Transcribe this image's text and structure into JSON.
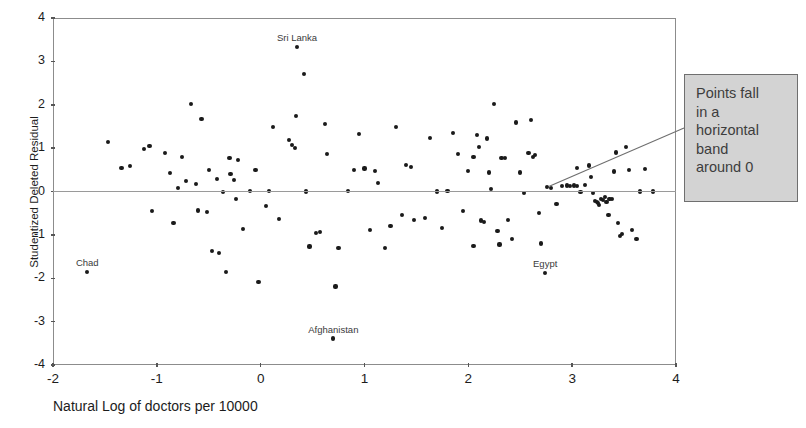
{
  "chart_data": {
    "type": "scatter",
    "title": "",
    "xlabel": "Natural Log of doctors per 10000",
    "ylabel": "Studentized Deleted Residual",
    "xlim": [
      -2,
      4
    ],
    "ylim": [
      -4,
      4
    ],
    "xticks": [
      -2,
      -1,
      0,
      1,
      2,
      3,
      4
    ],
    "xticklabels": [
      "-2",
      "-1",
      "0",
      "1",
      "2",
      "3",
      "4"
    ],
    "yticks": [
      -4,
      -3,
      -2,
      -1,
      0,
      1,
      2,
      3,
      4
    ],
    "yticklabels": [
      "-4",
      "-3",
      "-2",
      "-1",
      "0",
      "1",
      "2",
      "3",
      "4"
    ],
    "grid": false,
    "reference_line": {
      "axis": "y",
      "value": 0
    },
    "legend": null,
    "marker": {
      "shape": "circle",
      "color": "#1a1a1a",
      "size": 4
    },
    "points": [
      [
        -1.67,
        -1.86
      ],
      [
        -1.47,
        1.14
      ],
      [
        -1.34,
        0.54
      ],
      [
        -1.26,
        0.58
      ],
      [
        -1.12,
        0.98
      ],
      [
        -1.07,
        1.04
      ],
      [
        -1.05,
        -0.45
      ],
      [
        -0.92,
        0.88
      ],
      [
        -0.87,
        0.43
      ],
      [
        -0.84,
        -0.73
      ],
      [
        -0.8,
        0.09
      ],
      [
        -0.76,
        0.8
      ],
      [
        -0.72,
        0.25
      ],
      [
        -0.67,
        2.02
      ],
      [
        -0.62,
        0.17
      ],
      [
        -0.6,
        -0.44
      ],
      [
        -0.57,
        1.67
      ],
      [
        -0.52,
        -0.48
      ],
      [
        -0.5,
        0.49
      ],
      [
        -0.47,
        -1.37
      ],
      [
        -0.42,
        0.28
      ],
      [
        -0.4,
        -1.42
      ],
      [
        -0.36,
        -0.02
      ],
      [
        -0.33,
        -1.85
      ],
      [
        -0.29,
        0.4
      ],
      [
        -0.26,
        0.26
      ],
      [
        -0.24,
        -0.17
      ],
      [
        -0.22,
        0.72
      ],
      [
        -0.17,
        -0.86
      ],
      [
        -0.1,
        0.02
      ],
      [
        -0.05,
        0.5
      ],
      [
        -0.02,
        -2.08
      ],
      [
        0.08,
        0.01
      ],
      [
        0.12,
        1.48
      ],
      [
        0.18,
        -0.64
      ],
      [
        0.27,
        1.19
      ],
      [
        0.3,
        1.07
      ],
      [
        0.33,
        1.0
      ],
      [
        0.34,
        1.74
      ],
      [
        0.35,
        3.33
      ],
      [
        0.42,
        2.7
      ],
      [
        0.44,
        0.0
      ],
      [
        0.47,
        -1.27
      ],
      [
        0.53,
        -0.96
      ],
      [
        0.57,
        -0.94
      ],
      [
        0.62,
        1.56
      ],
      [
        0.64,
        0.87
      ],
      [
        0.7,
        -3.39
      ],
      [
        0.72,
        -2.19
      ],
      [
        0.75,
        -1.3
      ],
      [
        0.84,
        0.02
      ],
      [
        0.9,
        0.5
      ],
      [
        0.95,
        1.32
      ],
      [
        1.0,
        0.53
      ],
      [
        1.05,
        -0.88
      ],
      [
        1.1,
        0.48
      ],
      [
        1.13,
        0.2
      ],
      [
        1.25,
        -0.8
      ],
      [
        1.3,
        1.48
      ],
      [
        1.36,
        -0.54
      ],
      [
        1.4,
        0.62
      ],
      [
        1.45,
        0.57
      ],
      [
        1.48,
        -0.66
      ],
      [
        1.58,
        -0.62
      ],
      [
        1.63,
        1.23
      ],
      [
        1.7,
        0.0
      ],
      [
        1.75,
        -0.85
      ],
      [
        1.8,
        0.02
      ],
      [
        1.85,
        1.35
      ],
      [
        1.9,
        0.86
      ],
      [
        1.95,
        -0.45
      ],
      [
        2.0,
        0.48
      ],
      [
        2.05,
        0.8
      ],
      [
        2.08,
        1.3
      ],
      [
        2.1,
        1.03
      ],
      [
        2.12,
        -0.67
      ],
      [
        2.15,
        -0.7
      ],
      [
        2.18,
        1.22
      ],
      [
        2.2,
        0.44
      ],
      [
        2.22,
        0.05
      ],
      [
        2.25,
        2.02
      ],
      [
        2.28,
        -0.92
      ],
      [
        2.32,
        0.78
      ],
      [
        2.35,
        0.78
      ],
      [
        2.38,
        -0.65
      ],
      [
        2.42,
        -1.1
      ],
      [
        2.46,
        1.59
      ],
      [
        2.5,
        0.44
      ],
      [
        2.54,
        -0.03
      ],
      [
        2.58,
        0.88
      ],
      [
        2.6,
        1.65
      ],
      [
        2.62,
        0.8
      ],
      [
        2.64,
        0.85
      ],
      [
        2.68,
        -0.5
      ],
      [
        2.7,
        -1.2
      ],
      [
        2.74,
        -1.88
      ],
      [
        2.76,
        0.1
      ],
      [
        2.8,
        0.08
      ],
      [
        2.85,
        -0.28
      ],
      [
        2.9,
        0.12
      ],
      [
        2.95,
        0.14
      ],
      [
        2.98,
        0.13
      ],
      [
        3.02,
        0.14
      ],
      [
        3.05,
        0.12
      ],
      [
        3.08,
        -0.02
      ],
      [
        3.12,
        0.15
      ],
      [
        3.16,
        0.6
      ],
      [
        3.18,
        0.33
      ],
      [
        3.2,
        -0.04
      ],
      [
        3.22,
        -0.22
      ],
      [
        3.24,
        -0.25
      ],
      [
        3.25,
        -0.26
      ],
      [
        3.26,
        -0.32
      ],
      [
        3.28,
        -0.18
      ],
      [
        3.3,
        -0.2
      ],
      [
        3.32,
        -0.12
      ],
      [
        3.33,
        -0.24
      ],
      [
        3.35,
        -0.55
      ],
      [
        3.36,
        -0.17
      ],
      [
        3.38,
        -0.18
      ],
      [
        3.4,
        0.46
      ],
      [
        3.42,
        0.9
      ],
      [
        3.44,
        -0.72
      ],
      [
        3.46,
        -1.02
      ],
      [
        3.48,
        -0.98
      ],
      [
        3.52,
        1.02
      ],
      [
        3.55,
        0.5
      ],
      [
        3.58,
        -0.88
      ],
      [
        3.62,
        -1.1
      ],
      [
        3.65,
        0.0
      ],
      [
        3.7,
        0.52
      ],
      [
        3.78,
        0.0
      ],
      [
        -0.3,
        0.78
      ],
      [
        0.05,
        -0.33
      ],
      [
        1.2,
        -1.3
      ],
      [
        2.05,
        -1.25
      ],
      [
        2.3,
        -1.22
      ],
      [
        3.05,
        0.55
      ]
    ],
    "point_labels": [
      {
        "text": "Chad",
        "x": -1.67,
        "y": -1.86
      },
      {
        "text": "Sri Lanka",
        "x": 0.35,
        "y": 3.33
      },
      {
        "text": "Afghanistan",
        "x": 0.7,
        "y": -3.39
      },
      {
        "text": "Egypt",
        "x": 2.74,
        "y": -1.88
      }
    ],
    "annotations": [
      {
        "id": "callout",
        "text": "Points fall in a horizontal band around 0",
        "lines": [
          "Points fall",
          "in a",
          "horizontal",
          "band",
          "around 0"
        ],
        "background": "#d3d3d3",
        "border": "#6f6f6f",
        "leader_from": {
          "x": 2.78,
          "y": 0.12
        },
        "leader_to_px": {
          "x": 684,
          "y": 128
        }
      }
    ]
  }
}
